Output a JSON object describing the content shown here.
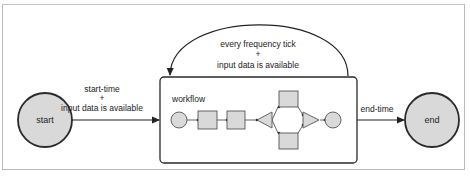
{
  "diagram": {
    "type": "workflow-lifecycle",
    "nodes": {
      "start": {
        "label": "start"
      },
      "end": {
        "label": "end"
      },
      "workflow": {
        "label": "workflow"
      }
    },
    "edges": {
      "start_to_workflow": {
        "line1": "start-time",
        "line2": "+",
        "line3": "input data is available"
      },
      "loop": {
        "line1": "every frequency tick",
        "line2": "+",
        "line3": "input data is available"
      },
      "workflow_to_end": {
        "label": "end-time"
      }
    },
    "inner_workflow_shapes": [
      "circle",
      "square",
      "square",
      "triangle-left",
      "square-top",
      "square-bottom",
      "triangle-right",
      "circle"
    ],
    "colors": {
      "fill": "#d9d9d9",
      "stroke": "#2a2a2a",
      "frame": "#b8b8b8"
    }
  }
}
